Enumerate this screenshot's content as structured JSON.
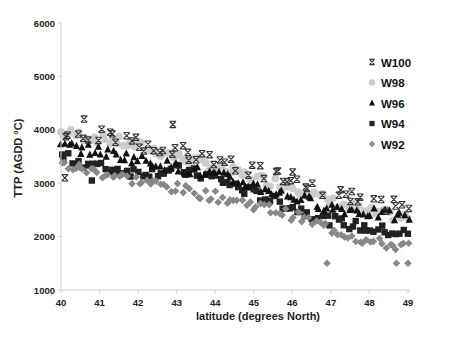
{
  "chart_data": {
    "type": "scatter",
    "title": "",
    "xlabel": "latitude (degrees North)",
    "ylabel": "TTP (AGDD °C)",
    "xlim": [
      40,
      49
    ],
    "ylim": [
      1000,
      6000
    ],
    "x_ticks": [
      "40",
      "41",
      "42",
      "43",
      "44",
      "45",
      "46",
      "47",
      "48",
      "49"
    ],
    "y_ticks": [
      "1000",
      "2000",
      "3000",
      "4000",
      "5000",
      "6000"
    ],
    "grid": false,
    "legend_position": "right",
    "series": [
      {
        "name": "W100",
        "marker": "asterisk",
        "color": "#333333",
        "trend": {
          "x": [
            40,
            41,
            42,
            43,
            44,
            45,
            46,
            47,
            48,
            49
          ],
          "y": [
            3950,
            3900,
            3750,
            3600,
            3450,
            3250,
            3100,
            2800,
            2650,
            2550
          ]
        },
        "outliers": [
          {
            "x": 40.1,
            "y": 3100
          },
          {
            "x": 42.9,
            "y": 4100
          },
          {
            "x": 40.6,
            "y": 4200
          }
        ]
      },
      {
        "name": "W98",
        "marker": "circle",
        "color": "#cccccc",
        "trend": {
          "x": [
            40,
            41,
            42,
            43,
            44,
            45,
            46,
            47,
            48,
            49
          ],
          "y": [
            3950,
            3850,
            3700,
            3500,
            3300,
            3100,
            2950,
            2650,
            2450,
            2350
          ]
        }
      },
      {
        "name": "W96",
        "marker": "triangle",
        "color": "#111111",
        "trend": {
          "x": [
            40,
            41,
            42,
            43,
            44,
            45,
            46,
            47,
            48,
            49
          ],
          "y": [
            3700,
            3600,
            3450,
            3300,
            3150,
            2950,
            2750,
            2550,
            2450,
            2350
          ]
        }
      },
      {
        "name": "W94",
        "marker": "square",
        "color": "#222222",
        "trend": {
          "x": [
            40,
            41,
            42,
            43,
            44,
            45,
            46,
            47,
            48,
            49
          ],
          "y": [
            3500,
            3300,
            3200,
            3250,
            3100,
            2800,
            2550,
            2300,
            2150,
            2050
          ]
        },
        "outliers": [
          {
            "x": 40.8,
            "y": 3050
          }
        ]
      },
      {
        "name": "W92",
        "marker": "diamond",
        "color": "#888888",
        "trend": {
          "x": [
            40,
            41,
            42,
            43,
            44,
            45,
            46,
            47,
            48,
            49
          ],
          "y": [
            3350,
            3200,
            3050,
            2900,
            2750,
            2600,
            2400,
            2150,
            1900,
            1800
          ]
        },
        "outliers": [
          {
            "x": 46.9,
            "y": 1500
          },
          {
            "x": 48.7,
            "y": 1500
          },
          {
            "x": 49.0,
            "y": 1500
          }
        ]
      }
    ]
  },
  "legend": {
    "items": [
      {
        "label": "W100"
      },
      {
        "label": "W98"
      },
      {
        "label": "W96"
      },
      {
        "label": "W94"
      },
      {
        "label": "W92"
      }
    ]
  },
  "axes": {
    "x_title": "latitude (degrees North)",
    "y_title": "TTP (AGDD °C)"
  }
}
